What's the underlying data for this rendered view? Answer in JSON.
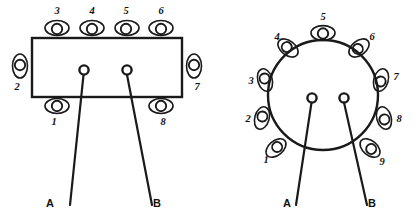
{
  "figure": {
    "background": "#ffffff",
    "ink_color": "#1a1a1a"
  },
  "diagrams": [
    {
      "id": "rectangular-socket",
      "shape": "rectangle",
      "pin_count": 8,
      "pins": [
        {
          "number": "1",
          "side": "bottom"
        },
        {
          "number": "2",
          "side": "left"
        },
        {
          "number": "3",
          "side": "top"
        },
        {
          "number": "4",
          "side": "top"
        },
        {
          "number": "5",
          "side": "top"
        },
        {
          "number": "6",
          "side": "top"
        },
        {
          "number": "7",
          "side": "right"
        },
        {
          "number": "8",
          "side": "bottom"
        }
      ],
      "terminals": [
        {
          "label": "A"
        },
        {
          "label": "B"
        }
      ]
    },
    {
      "id": "circular-socket",
      "shape": "circle",
      "pin_count": 9,
      "pins": [
        {
          "number": "1"
        },
        {
          "number": "2"
        },
        {
          "number": "3"
        },
        {
          "number": "4"
        },
        {
          "number": "5"
        },
        {
          "number": "6"
        },
        {
          "number": "7"
        },
        {
          "number": "8"
        },
        {
          "number": "9"
        }
      ],
      "terminals": [
        {
          "label": "A"
        },
        {
          "label": "B"
        }
      ]
    }
  ],
  "labels": {
    "rect": {
      "p1": "1",
      "p2": "2",
      "p3": "3",
      "p4": "4",
      "p5": "5",
      "p6": "6",
      "p7": "7",
      "p8": "8",
      "lead_a": "A",
      "lead_b": "B"
    },
    "circ": {
      "p1": "1",
      "p2": "2",
      "p3": "3",
      "p4": "4",
      "p5": "5",
      "p6": "6",
      "p7": "7",
      "p8": "8",
      "p9": "9",
      "lead_a": "A",
      "lead_b": "B"
    }
  }
}
